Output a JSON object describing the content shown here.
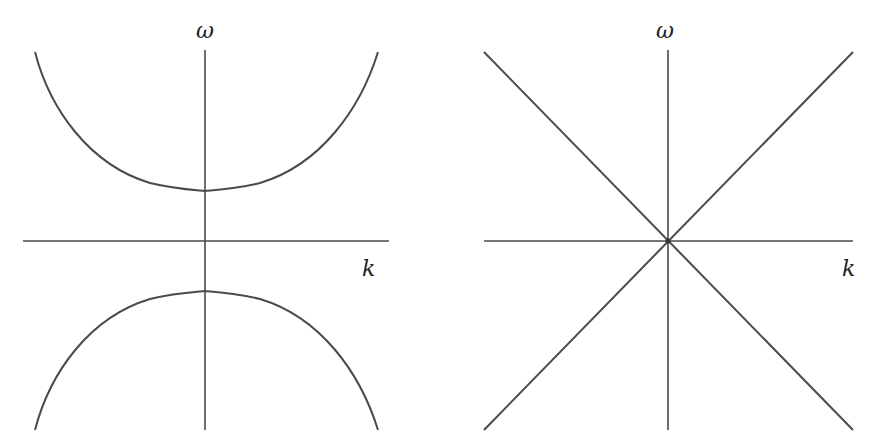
{
  "figure": {
    "line_color": "#4a4a4a",
    "background": "#ffffff",
    "panels": [
      {
        "id": "left",
        "type": "gapped-dispersion",
        "y_axis_label": "ω",
        "x_axis_label": "k",
        "origin": [
          205,
          241
        ],
        "gap_half_height_px": 50
      },
      {
        "id": "right",
        "type": "linear-dispersion",
        "y_axis_label": "ω",
        "x_axis_label": "k",
        "origin": [
          668,
          241
        ]
      }
    ]
  }
}
